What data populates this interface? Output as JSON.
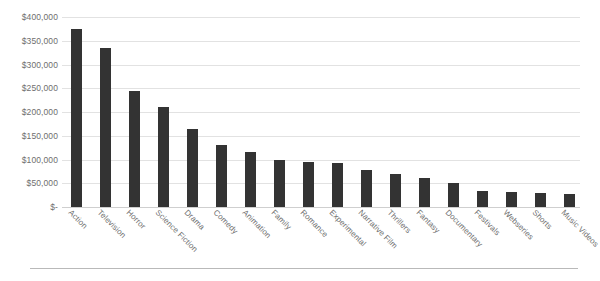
{
  "chart_data": {
    "type": "bar",
    "title": "",
    "subtitle": "",
    "xlabel": "",
    "ylabel": "",
    "ylim": [
      0,
      400000
    ],
    "grid": true,
    "legend": false,
    "legend_position": "none",
    "bar_color": "#333333",
    "gridline_color": "#e2e2e2",
    "axis_label_color": "#6e6e6e",
    "y_tick_labels": [
      "$400,000",
      "$350,000",
      "$300,000",
      "$250,000",
      "$200,000",
      "$150,000",
      "$100,000",
      "$50,000",
      "$-"
    ],
    "y_tick_values": [
      400000,
      350000,
      300000,
      250000,
      200000,
      150000,
      100000,
      50000,
      0
    ],
    "categories": [
      "Action",
      "Television",
      "Horror",
      "Science Fiction",
      "Drama",
      "Comedy",
      "Animation",
      "Family",
      "Romance",
      "Experimental",
      "Narrative Film",
      "Thrillers",
      "Fantasy",
      "Documentary",
      "Festivals",
      "Webseries",
      "Shorts",
      "Music Videos"
    ],
    "values": [
      375000,
      335000,
      245000,
      210000,
      165000,
      130000,
      115000,
      100000,
      95000,
      92000,
      78000,
      70000,
      62000,
      50000,
      34000,
      32000,
      30000,
      28000
    ]
  }
}
